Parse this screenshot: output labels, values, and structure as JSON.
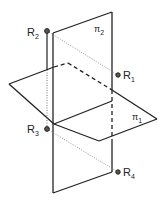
{
  "diagram": {
    "planes": [
      {
        "id": "pi1",
        "label": "π",
        "subscript": "1",
        "orientation": "horizontal"
      },
      {
        "id": "pi2",
        "label": "π",
        "subscript": "2",
        "orientation": "vertical"
      }
    ],
    "points": [
      {
        "id": "R1",
        "label": "R",
        "subscript": "1"
      },
      {
        "id": "R2",
        "label": "R",
        "subscript": "2"
      },
      {
        "id": "R3",
        "label": "R",
        "subscript": "3"
      },
      {
        "id": "R4",
        "label": "R",
        "subscript": "4"
      }
    ],
    "colors": {
      "line": "#222222",
      "dotted": "#777777"
    }
  }
}
